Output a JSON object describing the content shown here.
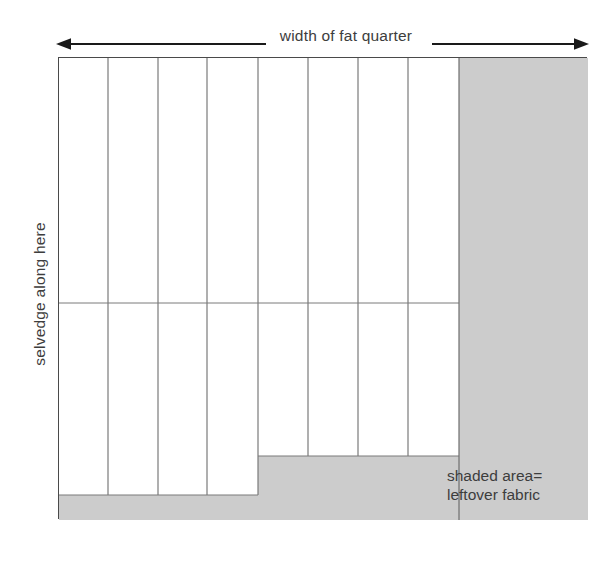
{
  "diagram": {
    "title_label": "width of fat quarter",
    "side_label": "selvedge along here",
    "legend_line_1": "shaded area=",
    "legend_line_2": "leftover fabric",
    "colors": {
      "shaded_fill": "#cccccc",
      "outline": "#4a4a4a",
      "strip_line": "#7a7a7a",
      "text": "#3d3d3d",
      "arrow": "#1a1a1a",
      "background": "#ffffff"
    },
    "geometry": {
      "rect_left": 58,
      "rect_top": 57,
      "rect_right": 587,
      "rect_bottom": 519,
      "shaded_column_left": 458,
      "strip_dividers_x": [
        58,
        107,
        157,
        206,
        257,
        307,
        357,
        407,
        458
      ],
      "horizontal_cut_y": 302,
      "tall_strips_bottom_y": 494,
      "short_strips_bottom_y": 455,
      "step_x": 257,
      "strip_count": 8,
      "arrow_axis_y": 44
    }
  }
}
